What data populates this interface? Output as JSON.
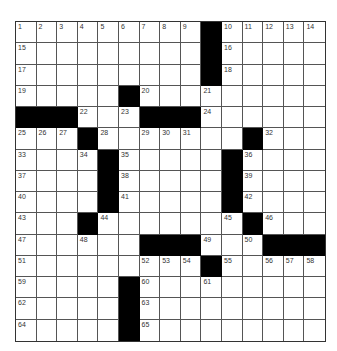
{
  "puzzle": {
    "rows": 15,
    "cols": 15,
    "black_cells": [
      [
        0,
        9
      ],
      [
        1,
        9
      ],
      [
        2,
        9
      ],
      [
        3,
        5
      ],
      [
        4,
        0
      ],
      [
        4,
        1
      ],
      [
        4,
        2
      ],
      [
        4,
        6
      ],
      [
        4,
        7
      ],
      [
        4,
        8
      ],
      [
        5,
        3
      ],
      [
        5,
        11
      ],
      [
        6,
        4
      ],
      [
        6,
        10
      ],
      [
        7,
        4
      ],
      [
        7,
        10
      ],
      [
        8,
        4
      ],
      [
        8,
        10
      ],
      [
        9,
        3
      ],
      [
        9,
        11
      ],
      [
        10,
        6
      ],
      [
        10,
        7
      ],
      [
        10,
        8
      ],
      [
        10,
        12
      ],
      [
        10,
        13
      ],
      [
        10,
        14
      ],
      [
        11,
        9
      ],
      [
        12,
        5
      ],
      [
        13,
        5
      ],
      [
        14,
        5
      ]
    ],
    "numbers": [
      {
        "r": 0,
        "c": 0,
        "n": "1"
      },
      {
        "r": 0,
        "c": 1,
        "n": "2"
      },
      {
        "r": 0,
        "c": 2,
        "n": "3"
      },
      {
        "r": 0,
        "c": 3,
        "n": "4"
      },
      {
        "r": 0,
        "c": 4,
        "n": "5"
      },
      {
        "r": 0,
        "c": 5,
        "n": "6"
      },
      {
        "r": 0,
        "c": 6,
        "n": "7"
      },
      {
        "r": 0,
        "c": 7,
        "n": "8"
      },
      {
        "r": 0,
        "c": 8,
        "n": "9"
      },
      {
        "r": 0,
        "c": 10,
        "n": "10"
      },
      {
        "r": 0,
        "c": 11,
        "n": "11"
      },
      {
        "r": 0,
        "c": 12,
        "n": "12"
      },
      {
        "r": 0,
        "c": 13,
        "n": "13"
      },
      {
        "r": 0,
        "c": 14,
        "n": "14"
      },
      {
        "r": 1,
        "c": 0,
        "n": "15"
      },
      {
        "r": 1,
        "c": 10,
        "n": "16"
      },
      {
        "r": 2,
        "c": 0,
        "n": "17"
      },
      {
        "r": 2,
        "c": 10,
        "n": "18"
      },
      {
        "r": 3,
        "c": 0,
        "n": "19"
      },
      {
        "r": 3,
        "c": 6,
        "n": "20"
      },
      {
        "r": 3,
        "c": 9,
        "n": "21"
      },
      {
        "r": 4,
        "c": 3,
        "n": "22"
      },
      {
        "r": 4,
        "c": 5,
        "n": "23"
      },
      {
        "r": 4,
        "c": 9,
        "n": "24"
      },
      {
        "r": 5,
        "c": 0,
        "n": "25"
      },
      {
        "r": 5,
        "c": 1,
        "n": "26"
      },
      {
        "r": 5,
        "c": 2,
        "n": "27"
      },
      {
        "r": 5,
        "c": 4,
        "n": "28"
      },
      {
        "r": 5,
        "c": 6,
        "n": "29"
      },
      {
        "r": 5,
        "c": 7,
        "n": "30"
      },
      {
        "r": 5,
        "c": 8,
        "n": "31"
      },
      {
        "r": 5,
        "c": 12,
        "n": "32"
      },
      {
        "r": 6,
        "c": 0,
        "n": "33"
      },
      {
        "r": 6,
        "c": 3,
        "n": "34"
      },
      {
        "r": 6,
        "c": 5,
        "n": "35"
      },
      {
        "r": 6,
        "c": 11,
        "n": "36"
      },
      {
        "r": 7,
        "c": 0,
        "n": "37"
      },
      {
        "r": 7,
        "c": 5,
        "n": "38"
      },
      {
        "r": 7,
        "c": 11,
        "n": "39"
      },
      {
        "r": 8,
        "c": 0,
        "n": "40"
      },
      {
        "r": 8,
        "c": 5,
        "n": "41"
      },
      {
        "r": 8,
        "c": 11,
        "n": "42"
      },
      {
        "r": 9,
        "c": 0,
        "n": "43"
      },
      {
        "r": 9,
        "c": 4,
        "n": "44"
      },
      {
        "r": 9,
        "c": 10,
        "n": "45"
      },
      {
        "r": 9,
        "c": 12,
        "n": "46"
      },
      {
        "r": 10,
        "c": 0,
        "n": "47"
      },
      {
        "r": 10,
        "c": 3,
        "n": "48"
      },
      {
        "r": 10,
        "c": 9,
        "n": "49"
      },
      {
        "r": 10,
        "c": 11,
        "n": "50"
      },
      {
        "r": 11,
        "c": 0,
        "n": "51"
      },
      {
        "r": 11,
        "c": 6,
        "n": "52"
      },
      {
        "r": 11,
        "c": 7,
        "n": "53"
      },
      {
        "r": 11,
        "c": 8,
        "n": "54"
      },
      {
        "r": 11,
        "c": 10,
        "n": "55"
      },
      {
        "r": 11,
        "c": 12,
        "n": "56"
      },
      {
        "r": 11,
        "c": 13,
        "n": "57"
      },
      {
        "r": 11,
        "c": 14,
        "n": "58"
      },
      {
        "r": 12,
        "c": 0,
        "n": "59"
      },
      {
        "r": 12,
        "c": 6,
        "n": "60"
      },
      {
        "r": 12,
        "c": 9,
        "n": "61"
      },
      {
        "r": 13,
        "c": 0,
        "n": "62"
      },
      {
        "r": 13,
        "c": 6,
        "n": "63"
      },
      {
        "r": 14,
        "c": 0,
        "n": "64"
      },
      {
        "r": 14,
        "c": 6,
        "n": "65"
      }
    ]
  },
  "colors": {
    "block": "#000000",
    "cell": "#ffffff",
    "grid_line": "#555555"
  }
}
